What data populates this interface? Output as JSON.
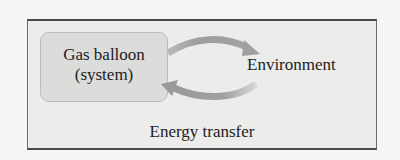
{
  "diagram": {
    "system": {
      "line1": "Gas balloon",
      "line2": "(system)"
    },
    "environment_label": "Environment",
    "caption": "Energy transfer",
    "arrows": [
      {
        "from": "system",
        "to": "environment",
        "direction": "right"
      },
      {
        "from": "environment",
        "to": "system",
        "direction": "left"
      }
    ],
    "colors": {
      "outer_fill": "#ececeb",
      "outer_border": "#4a4a4a",
      "system_fill": "#dcdcdb",
      "arrow": "#9a9a99",
      "text": "#222222"
    }
  }
}
